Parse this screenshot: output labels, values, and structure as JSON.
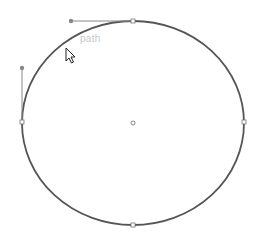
{
  "canvas": {
    "background": "#ffffff",
    "stroke_color": "#555555",
    "handle_color": "#888888",
    "ellipse": {
      "cx": 133,
      "cy": 123,
      "rx": 111,
      "ry": 102
    },
    "anchors": [
      {
        "name": "top",
        "x": 133,
        "y": 21
      },
      {
        "name": "left",
        "x": 22,
        "y": 122
      },
      {
        "name": "right",
        "x": 244,
        "y": 122
      },
      {
        "name": "bottom",
        "x": 133,
        "y": 225
      }
    ],
    "center_point": {
      "x": 133,
      "y": 123
    },
    "handles": [
      {
        "from": {
          "x": 133,
          "y": 21
        },
        "to": {
          "x": 71,
          "y": 21
        }
      },
      {
        "from": {
          "x": 22,
          "y": 122
        },
        "to": {
          "x": 22,
          "y": 68
        }
      }
    ],
    "cursor": {
      "x": 66,
      "y": 48,
      "icon": "arrow-pointer-icon"
    },
    "hint_text": "path"
  }
}
